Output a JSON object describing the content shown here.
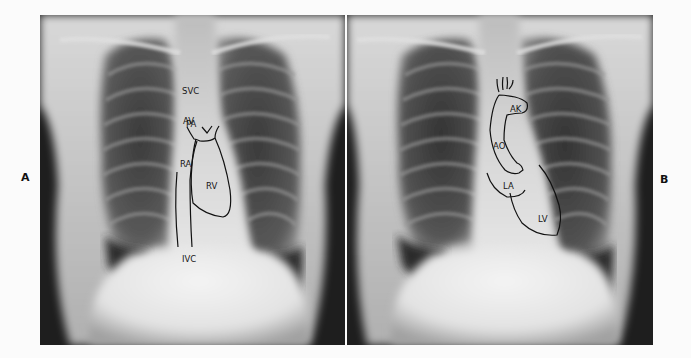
{
  "figure": {
    "panels": [
      {
        "letter": "A",
        "description": "PA chest radiograph with right heart structures outlined",
        "labels": {
          "svc": "SVC",
          "av": "AV",
          "pa": "PA",
          "ra": "RA",
          "rv": "RV",
          "ivc": "IVC"
        }
      },
      {
        "letter": "B",
        "description": "PA chest radiograph with left heart structures outlined",
        "labels": {
          "ak": "AK",
          "ao": "AO",
          "la": "LA",
          "lv": "LV"
        }
      }
    ],
    "colors": {
      "background": "#fbfbfb",
      "outline": "#111111",
      "film_dark": "#1a1a1a",
      "film_light": "#e8e8e8"
    }
  }
}
